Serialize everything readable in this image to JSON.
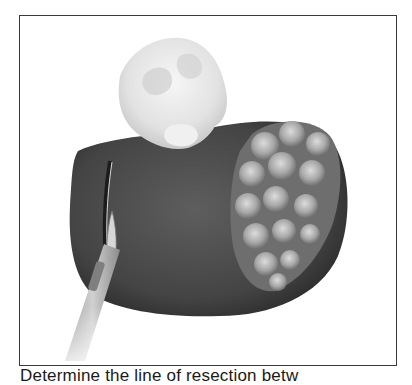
{
  "figure": {
    "elements": [
      "hand-holding-tissue",
      "organ",
      "tumor-nodular-mass",
      "scalpel",
      "incision-line"
    ],
    "colors": {
      "frame": "#3a3a3a",
      "organ": "#4a4a4a",
      "organ_dark": "#2c2c2c",
      "tumor_light": "#c8c8c8",
      "tumor_dark": "#6a6a6a",
      "hand": "#e6e6e6",
      "scalpel": "#b5b5b5"
    }
  },
  "caption": {
    "text": "Determine the line of resection betw"
  }
}
